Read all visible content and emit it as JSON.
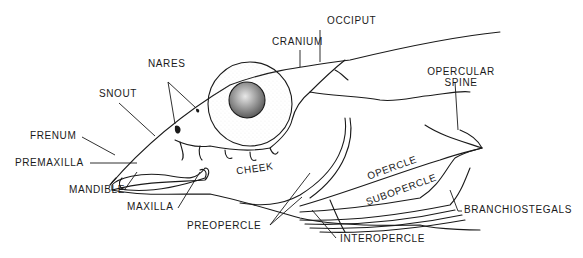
{
  "diagram": {
    "colors": {
      "ink": "#1a1a1a",
      "background": "#ffffff",
      "iris_shade": "#9a9a9a"
    },
    "labels": {
      "occiput": "OCCIPUT",
      "cranium": "CRANIUM",
      "nares": "NARES",
      "snout": "SNOUT",
      "opercular_spine_line1": "OPERCULAR",
      "opercular_spine_line2": "SPINE",
      "frenum": "FRENUM",
      "premaxilla": "PREMAXILLA",
      "mandible": "MANDIBLE",
      "maxilla": "MAXILLA",
      "cheek": "CHEEK",
      "opercle": "OPERCLE",
      "subopercle": "SUBOPERCLE",
      "branchiostegals": "BRANCHIOSTEGALS",
      "preopercle": "PREOPERCLE",
      "interopercle": "INTEROPERCLE"
    }
  }
}
